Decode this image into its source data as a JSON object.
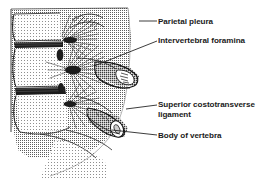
{
  "figure": {
    "kind": "anatomical-line-drawing",
    "width": 268,
    "height": 179,
    "background_color": "#ffffff",
    "ink_color": "#1a1a1a",
    "stipple_color": "#6e6e6e"
  },
  "labels": [
    {
      "id": "parietal-pleura",
      "text": "Parietal pleura",
      "lines": [
        "Parietal pleura"
      ],
      "leader": {
        "x1": 139,
        "y1": 21,
        "x2": 157,
        "y2": 21
      }
    },
    {
      "id": "intervertebral-foramina",
      "text": "Intervertebral foramina",
      "lines": [
        "Intervertebral foramina"
      ],
      "leader": {
        "x1": 94,
        "y1": 66,
        "x2": 157,
        "y2": 41
      }
    },
    {
      "id": "superior-costotransverse-ligament",
      "text": "Superior costotransverse ligament",
      "lines": [
        "Superior costotransverse",
        "ligament"
      ],
      "leader": {
        "x1": 126,
        "y1": 109,
        "x2": 157,
        "y2": 105
      }
    },
    {
      "id": "body-of-vertebra",
      "text": "Body of vertebra",
      "lines": [
        "Body of vertebra"
      ],
      "leader": {
        "x1": 112,
        "y1": 130,
        "x2": 157,
        "y2": 135
      }
    }
  ]
}
